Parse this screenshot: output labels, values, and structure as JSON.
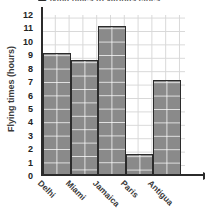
{
  "chart_data": {
    "type": "bar",
    "title": "Flying times to various cities",
    "xlabel": "",
    "ylabel": "Flying times (hours)",
    "categories": [
      "Delhi",
      "Miami",
      "Jamaica",
      "Paris",
      "Antigua"
    ],
    "values": [
      9,
      8.5,
      11,
      1.5,
      7
    ],
    "ylim": [
      0,
      12
    ],
    "ytick_labels": [
      "12",
      "11",
      "10",
      "9",
      "8",
      "7",
      "6",
      "5",
      "4",
      "3",
      "2",
      "1",
      "0"
    ],
    "ytick_values": [
      12,
      11,
      10,
      9,
      8,
      7,
      6,
      5,
      4,
      3,
      2,
      1,
      0
    ],
    "grid": true,
    "legend": false,
    "bar_color": "#8a8a8a",
    "bar_edge_color": "#2b2b2b",
    "grid_color": "#d8d8d8",
    "axis_color": "#2b2b2b"
  }
}
